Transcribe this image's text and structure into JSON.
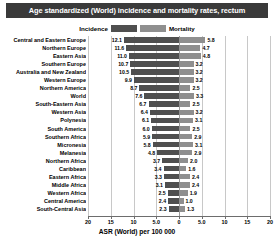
{
  "chart_data": {
    "type": "bar",
    "title": "Age standardized (World) incidence and mortality rates, rectum",
    "xlabel": "ASR (World) per 100 000",
    "ylabel": "",
    "orientation": "horizontal-diverging",
    "grid": true,
    "legend_position": "top-center",
    "xlim": [
      -20,
      20
    ],
    "xticks": [
      "20",
      "15",
      "10",
      "5.0",
      "0",
      "5.0",
      "10",
      "15",
      "20"
    ],
    "xtick_values": [
      -20,
      -15,
      -10,
      -5,
      0,
      5,
      10,
      15,
      20
    ],
    "categories": [
      "Central and Eastern Europe",
      "Northern Europe",
      "Eastern Asia",
      "Southern Europe",
      "Australia and New Zealand",
      "Western Europe",
      "Northern America",
      "World",
      "South-Eastern Asia",
      "Western Asia",
      "Polynesia",
      "South America",
      "Southern Africa",
      "Micronesia",
      "Melanesia",
      "Northern Africa",
      "Caribbean",
      "Eastern Africa",
      "Middle Africa",
      "Western Africa",
      "Central America",
      "South-Central Asia"
    ],
    "series": [
      {
        "name": "Incidence",
        "color": "#4f4f4f",
        "values": [
          12.1,
          11.6,
          11.0,
          10.7,
          10.5,
          9.9,
          8.7,
          7.6,
          6.7,
          6.4,
          6.1,
          6.0,
          5.9,
          5.8,
          4.8,
          3.7,
          3.4,
          3.3,
          3.1,
          2.5,
          2.4,
          2.3
        ]
      },
      {
        "name": "Mortality",
        "color": "#8f8f8f",
        "values": [
          5.8,
          4.7,
          4.8,
          3.2,
          3.2,
          3.2,
          2.5,
          3.3,
          2.5,
          3.2,
          3.1,
          2.5,
          2.9,
          3.1,
          2.9,
          2.0,
          1.6,
          2.4,
          2.4,
          1.9,
          1.0,
          1.3
        ]
      }
    ]
  },
  "legend": {
    "incidence_label": "Incidence",
    "mortality_label": "Mortality"
  }
}
